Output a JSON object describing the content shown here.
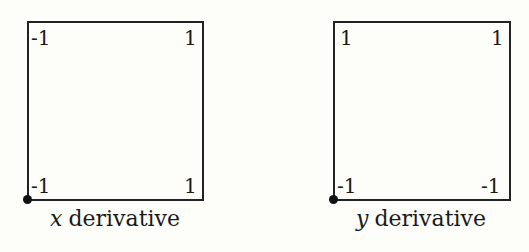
{
  "panels": [
    {
      "caption_var": "x",
      "caption_text": "derivative",
      "corners": {
        "top_left": "-1",
        "top_right": "1",
        "bottom_left": "-1",
        "bottom_right": "1"
      }
    },
    {
      "caption_var": "y",
      "caption_text": "derivative",
      "corners": {
        "top_left": "1",
        "top_right": "1",
        "bottom_left": "-1",
        "bottom_right": "-1"
      }
    }
  ]
}
